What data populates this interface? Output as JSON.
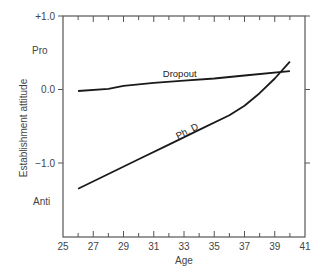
{
  "chart_data": {
    "type": "line",
    "title": "",
    "xlabel": "Age",
    "ylabel": "Establishment attitude",
    "xlim": [
      25,
      41
    ],
    "ylim": [
      -2.0,
      1.0
    ],
    "x_ticks": [
      "25",
      "27",
      "29",
      "31",
      "33",
      "35",
      "37",
      "39",
      "41"
    ],
    "y_ticks": [
      "+1.0",
      "0.0",
      "−1.0"
    ],
    "y_annotations": [
      "Pro",
      "Anti"
    ],
    "grid": false,
    "legend": "inline labels",
    "series": [
      {
        "name": "Dropout",
        "x": [
          26,
          28,
          29,
          31,
          33,
          35,
          37,
          40
        ],
        "y": [
          -0.02,
          0.01,
          0.05,
          0.09,
          0.12,
          0.15,
          0.19,
          0.25
        ]
      },
      {
        "name": "Ph. D",
        "x": [
          26,
          28,
          30,
          32,
          34,
          36,
          37,
          38,
          39,
          40
        ],
        "y": [
          -1.35,
          -1.15,
          -0.95,
          -0.75,
          -0.55,
          -0.35,
          -0.22,
          -0.05,
          0.15,
          0.38
        ]
      }
    ]
  }
}
